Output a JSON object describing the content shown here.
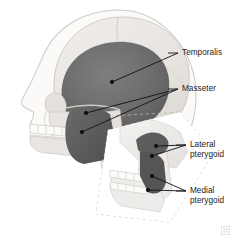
{
  "figure": {
    "background_color": "#ffffff",
    "width": 240,
    "height": 243
  },
  "palette": {
    "skull_bone": "#e9e7e3",
    "skull_bone_shadow": "#d8d5d0",
    "soft_tissue_outline": "#cfcbc5",
    "teeth": "#fafafa",
    "temporalis_muscle": "#6f6f6f",
    "masseter_muscle": "#5e5e5e",
    "pterygoid_muscle": "#575757",
    "leader_line": "#111111",
    "label_text": "#1a1a1a",
    "dashed_guide": "#b9b5af"
  },
  "labels": {
    "temporalis": "Temporalis",
    "masseter": "Masseter",
    "lateral_pterygoid": "Lateral\npterygoid",
    "medial_pterygoid": "Medial\npterygoid"
  },
  "structures": {
    "skull": "lateral-view-skull",
    "face_profile": "soft-tissue-face-outline",
    "upper_teeth": "maxillary-dental-arch",
    "lower_teeth": "mandibular-dental-arch",
    "mandible": "mandible",
    "inset": "magnified-pterygoid-region"
  },
  "icons": {
    "watermark": "publisher-watermark-icon"
  }
}
